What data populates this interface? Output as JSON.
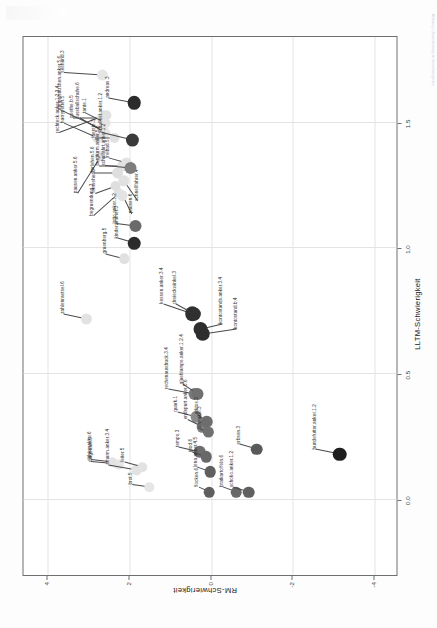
{
  "figure": {
    "xaxis_title": "LLTM-Schwierigkeit",
    "yaxis_title": "RM-Schwierigkeit"
  },
  "margin_note": "Abbildung 1. Zusammenhang der Itemschwierigkeiten",
  "chart_data": {
    "type": "scatter",
    "title": "",
    "xlabel": "LLTM-Schwierigkeit",
    "ylabel": "RM-Schwierigkeit",
    "xlim": [
      -0.3,
      1.85
    ],
    "ylim": [
      -4.6,
      4.6
    ],
    "xticks": [
      0.0,
      0.5,
      1.0,
      1.5
    ],
    "xticklabels": [
      "0.0",
      "0.5",
      "1.0",
      "1.5"
    ],
    "yticks": [
      4,
      2,
      0,
      -2,
      -4
    ],
    "yticklabels": [
      "4",
      "2",
      "0",
      "-2",
      "-4"
    ],
    "grid": true,
    "legend": "none",
    "points": [
      {
        "label": "zahlenraetsel.6",
        "x": 0.72,
        "y": 3.05,
        "shade": "#e2e2e2",
        "r": 5.6,
        "lx": 0.74,
        "ly": 3.62
      },
      {
        "label": "gruenberg.5",
        "x": 0.96,
        "y": 2.12,
        "shade": "#e0e0e0",
        "r": 5.2,
        "lx": 0.98,
        "ly": 2.6
      },
      {
        "label": "pausen.anker.5.6",
        "x": 1.37,
        "y": 2.72,
        "shade": "#e0e0e0",
        "r": 5.4,
        "lx": 1.22,
        "ly": 3.3
      },
      {
        "label": "begruendung.3",
        "x": 1.22,
        "y": 2.28,
        "shade": "#e2e2e2",
        "r": 5.0,
        "lx": 1.13,
        "ly": 2.9
      },
      {
        "label": "harrypotter.5",
        "x": 1.44,
        "y": 2.78,
        "shade": "#e4e4e4",
        "r": 5.2,
        "lx": 1.5,
        "ly": 3.62
      },
      {
        "label": "rumpelstilzchen.anker.5.6",
        "x": 1.47,
        "y": 2.66,
        "shade": "#e2e2e2",
        "r": 5.4,
        "lx": 1.55,
        "ly": 3.7
      },
      {
        "label": "fussballschuhe.6",
        "x": 1.46,
        "y": 2.6,
        "shade": "#e6e6e6",
        "r": 5.0,
        "lx": 1.52,
        "ly": 3.24
      },
      {
        "label": "pausen.6",
        "x": 1.21,
        "y": 2.17,
        "shade": "#e3e3e3",
        "r": 5.2,
        "lx": 1.14,
        "ly": 1.96
      },
      {
        "label": "fernseher.3",
        "x": 1.25,
        "y": 2.35,
        "shade": "#dedede",
        "r": 5.0,
        "lx": 1.22,
        "ly": 2.86
      },
      {
        "label": "schnellfahrer.4",
        "x": 1.27,
        "y": 2.14,
        "shade": "#e1e1e1",
        "r": 5.2,
        "lx": 1.19,
        "ly": 1.8
      },
      {
        "label": "darlehen.5.6",
        "x": 1.3,
        "y": 2.3,
        "shade": "#dfdfdf",
        "r": 5.4,
        "lx": 1.3,
        "ly": 2.88
      },
      {
        "label": "burgturm.anker.5.6",
        "x": 1.33,
        "y": 2.16,
        "shade": "#e0e0e0",
        "r": 5.2,
        "lx": 1.33,
        "ly": 2.76
      },
      {
        "label": "freibad.5",
        "x": 1.34,
        "y": 2.08,
        "shade": "#e2e2e2",
        "r": 5.6,
        "lx": 1.36,
        "ly": 2.52
      },
      {
        "label": "rechteck.anker.1.2.3.4",
        "x": 1.53,
        "y": 2.58,
        "shade": "#e1e1e1",
        "r": 5.2,
        "lx": 1.46,
        "ly": 3.74
      },
      {
        "label": "goethe.b.5",
        "x": 1.52,
        "y": 2.68,
        "shade": "#e3e3e3",
        "r": 5.0,
        "lx": 1.52,
        "ly": 3.4
      },
      {
        "label": "tante.1",
        "x": 1.5,
        "y": 2.58,
        "shade": "#e4e4e4",
        "r": 5.0,
        "lx": 1.54,
        "ly": 3.08
      },
      {
        "label": "fuerste.3",
        "x": 1.44,
        "y": 2.36,
        "shade": "#e0e0e0",
        "r": 5.0,
        "lx": 1.44,
        "ly": 2.86
      },
      {
        "label": "seehund.3",
        "x": 1.69,
        "y": 2.66,
        "shade": "#e5e5e5",
        "r": 5.6,
        "lx": 1.7,
        "ly": 3.62
      },
      {
        "label": "schulfahrt.anker.1.2",
        "x": 1.32,
        "y": 1.98,
        "shade": "#7d7d7d",
        "r": 6.0,
        "lx": 1.33,
        "ly": 2.62
      },
      {
        "label": "schulfest.anker.1.2",
        "x": 1.43,
        "y": 1.92,
        "shade": "#3a3a3a",
        "r": 6.6,
        "lx": 1.46,
        "ly": 2.68
      },
      {
        "label": "lotto.anker.1.2",
        "x": 1.09,
        "y": 1.86,
        "shade": "#6a6a6a",
        "r": 6.0,
        "lx": 1.1,
        "ly": 2.34
      },
      {
        "label": "andreas.3",
        "x": 1.58,
        "y": 1.88,
        "shade": "#2b2b2b",
        "r": 6.8,
        "lx": 1.6,
        "ly": 2.52
      },
      {
        "label": "kinderzimmer.3",
        "x": 1.02,
        "y": 1.88,
        "shade": "#2b2b2b",
        "r": 6.8,
        "lx": 1.04,
        "ly": 2.3
      },
      {
        "label": "kessen.anker.3.4",
        "x": 0.74,
        "y": 0.46,
        "shade": "#303030",
        "r": 7.2,
        "lx": 0.78,
        "ly": 1.18
      },
      {
        "label": "dreieckwinkel.3",
        "x": 0.74,
        "y": 0.42,
        "shade": "#303030",
        "r": 6.6,
        "lx": 0.78,
        "ly": 0.86
      },
      {
        "label": "kontostands.anker.3.4",
        "x": 0.68,
        "y": 0.26,
        "shade": "#2e2e2e",
        "r": 7.0,
        "lx": 0.7,
        "ly": -0.26
      },
      {
        "label": "kontostand.b.4",
        "x": 0.66,
        "y": 0.2,
        "shade": "#2e2e2e",
        "r": 6.8,
        "lx": 0.68,
        "ly": -0.62
      },
      {
        "label": "rechenausdruck.3.4",
        "x": 0.42,
        "y": 0.4,
        "shade": "#7a7a7a",
        "r": 6.0,
        "lx": 0.44,
        "ly": 1.06
      },
      {
        "label": "gluehlampe.anker.1.2.4",
        "x": 0.42,
        "y": 0.32,
        "shade": "#707070",
        "r": 6.0,
        "lx": 0.46,
        "ly": 0.7
      },
      {
        "label": "quark.1",
        "x": 0.33,
        "y": 0.36,
        "shade": "#8a8a8a",
        "r": 5.8,
        "lx": 0.35,
        "ly": 0.84
      },
      {
        "label": "endspurt.anker.5.6",
        "x": 0.29,
        "y": 0.22,
        "shade": "#7c7c7c",
        "r": 5.8,
        "lx": 0.32,
        "ly": 0.6
      },
      {
        "label": "arktos.3",
        "x": 0.31,
        "y": 0.1,
        "shade": "#6e6e6e",
        "r": 5.8,
        "lx": 0.34,
        "ly": 0.34
      },
      {
        "label": "schaukel.3",
        "x": 0.27,
        "y": 0.06,
        "shade": "#707070",
        "r": 5.6,
        "lx": 0.28,
        "ly": 0.26
      },
      {
        "label": "diagonale.5",
        "x": 0.14,
        "y": 2.26,
        "shade": "#e6e6e6",
        "r": 5.4,
        "lx": 0.15,
        "ly": 2.94
      },
      {
        "label": "lithiumakku.6",
        "x": 0.15,
        "y": 2.42,
        "shade": "#e4e4e4",
        "r": 5.2,
        "lx": 0.16,
        "ly": 2.96
      },
      {
        "label": "smurm.anker.3.4",
        "x": 0.12,
        "y": 1.82,
        "shade": "#e2e2e2",
        "r": 5.4,
        "lx": 0.14,
        "ly": 2.52
      },
      {
        "label": "leiter.5",
        "x": 0.13,
        "y": 1.68,
        "shade": "#e2e2e2",
        "r": 5.2,
        "lx": 0.15,
        "ly": 2.14
      },
      {
        "label": "brot.5",
        "x": 0.05,
        "y": 1.52,
        "shade": "#e6e6e6",
        "r": 5.2,
        "lx": 0.06,
        "ly": 1.96
      },
      {
        "label": "tempo.3",
        "x": 0.19,
        "y": 0.28,
        "shade": "#6e6e6e",
        "r": 5.8,
        "lx": 0.21,
        "ly": 0.8
      },
      {
        "label": "ipod.6",
        "x": 0.17,
        "y": 0.12,
        "shade": "#686868",
        "r": 5.8,
        "lx": 0.19,
        "ly": 0.48
      },
      {
        "label": "lena.anker.4.5",
        "x": 0.11,
        "y": 0.02,
        "shade": "#5f5f5f",
        "r": 5.8,
        "lx": 0.13,
        "ly": 0.36
      },
      {
        "label": "flocken.6",
        "x": 0.03,
        "y": 0.04,
        "shade": "#5f5f5f",
        "r": 5.8,
        "lx": 0.05,
        "ly": 0.32
      },
      {
        "label": "bratkartoffeln.6",
        "x": 0.03,
        "y": -0.62,
        "shade": "#686868",
        "r": 5.8,
        "lx": 0.05,
        "ly": -0.28
      },
      {
        "label": "schoko.anker.1.2",
        "x": 0.03,
        "y": -0.92,
        "shade": "#606060",
        "r": 5.8,
        "lx": 0.05,
        "ly": -0.52
      },
      {
        "label": "erbsen.3",
        "x": 0.2,
        "y": -1.12,
        "shade": "#5a5a5a",
        "r": 5.8,
        "lx": 0.22,
        "ly": -0.7
      },
      {
        "label": "hundefutter.anker.1.2",
        "x": 0.18,
        "y": -3.16,
        "shade": "#1f1f1f",
        "r": 6.8,
        "lx": 0.2,
        "ly": -2.56
      }
    ]
  }
}
